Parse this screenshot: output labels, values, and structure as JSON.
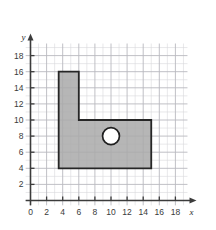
{
  "figure": {
    "title": "",
    "background_color": "#ffffff"
  },
  "chart_data": {
    "type": "scatter",
    "title": "",
    "xlabel": "x",
    "ylabel": "y",
    "grid": true,
    "legend": null,
    "xlim": [
      0,
      19.5
    ],
    "ylim": [
      0,
      19.5
    ],
    "x_tick_labels": [
      "0",
      "2",
      "4",
      "6",
      "8",
      "10",
      "12",
      "14",
      "16",
      "18"
    ],
    "x_tick_values": [
      0,
      2,
      4,
      6,
      8,
      10,
      12,
      14,
      16,
      18
    ],
    "y_tick_labels": [
      "0",
      "2",
      "4",
      "6",
      "8",
      "10",
      "12",
      "14",
      "16",
      "18"
    ],
    "y_tick_values": [
      0,
      2,
      4,
      6,
      8,
      10,
      12,
      14,
      16,
      18
    ],
    "grid_minor_step": 1,
    "grid_major_step": 2,
    "shapes": [
      {
        "name": "l-shaped-region",
        "kind": "polygon",
        "fill_color": "#a9a9a9",
        "edge_color": "#262626",
        "vertices": [
          [
            3.5,
            4
          ],
          [
            3.5,
            16
          ],
          [
            6,
            16
          ],
          [
            6,
            10
          ],
          [
            15,
            10
          ],
          [
            15,
            4
          ]
        ]
      },
      {
        "name": "circular-hole",
        "kind": "circle",
        "fill_color": "#ffffff",
        "edge_color": "#1f1f1f",
        "center": [
          10,
          8
        ],
        "radius": 1.05
      }
    ],
    "axis_arrows": [
      "x",
      "y"
    ]
  },
  "colors": {
    "grid_minor": "#d8d8dc",
    "grid_major": "#b9b9c0",
    "axis": "#3c3c3c",
    "shape_fill": "#a9a9a9",
    "shape_edge": "#262626",
    "hole_fill": "#ffffff",
    "hole_edge": "#1f1f1f",
    "tick_text": "#3a3a3a"
  }
}
